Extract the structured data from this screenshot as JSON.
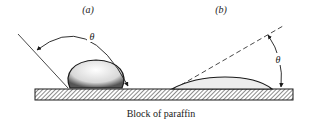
{
  "figure": {
    "panels": [
      {
        "id": "a",
        "label": "(a)",
        "angle_symbol": "θ",
        "description": "droplet with large contact angle"
      },
      {
        "id": "b",
        "label": "(b)",
        "angle_symbol": "θ",
        "description": "spread droplet with small contact angle"
      }
    ],
    "caption": "Block of paraffin",
    "colors": {
      "ink": "#1a1a1a",
      "background": "#ffffff"
    }
  }
}
